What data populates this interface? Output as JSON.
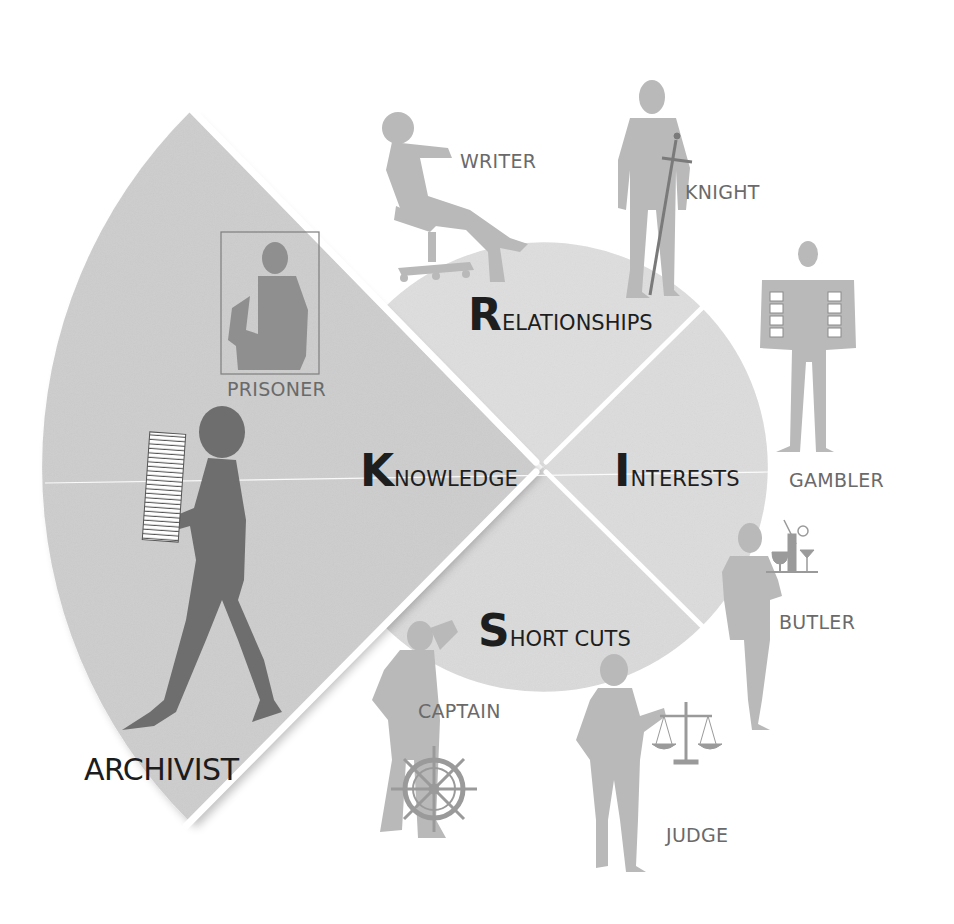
{
  "diagram": {
    "type": "segmented-circle-with-role-silhouettes",
    "center": [
      543,
      467
    ],
    "colors": {
      "background": "#ffffff",
      "segment_fill": "#dcdcdc",
      "knowledge_fill": "#cfcfcf",
      "divider": "#ffffff",
      "segment_text": "#1e1e1e",
      "role_text": "#6a6a6a",
      "archivist_text": "#1c1c1c",
      "silhouette_light": "#b9b9b9",
      "silhouette_dark": "#6e6e6e"
    },
    "segments": [
      {
        "id": "relationships",
        "initial": "R",
        "rest": "ELATIONSHIPS",
        "label": "Relationships"
      },
      {
        "id": "interests",
        "initial": "I",
        "rest": "NTERESTS",
        "label": "Interests"
      },
      {
        "id": "short_cuts",
        "initial": "S",
        "rest": "HORT CUTS",
        "label": "Short cuts"
      },
      {
        "id": "knowledge",
        "initial": "K",
        "rest": "NOWLEDGE",
        "label": "Knowledge",
        "highlighted": true
      }
    ],
    "roles": [
      {
        "id": "writer",
        "label": "WRITER",
        "segment": "relationships"
      },
      {
        "id": "knight",
        "label": "KNIGHT",
        "segment": "relationships"
      },
      {
        "id": "gambler",
        "label": "GAMBLER",
        "segment": "interests"
      },
      {
        "id": "butler",
        "label": "BUTLER",
        "segment": "interests"
      },
      {
        "id": "captain",
        "label": "CAPTAIN",
        "segment": "short_cuts"
      },
      {
        "id": "judge",
        "label": "JUDGE",
        "segment": "short_cuts"
      },
      {
        "id": "prisoner",
        "label": "PRISONER",
        "segment": "knowledge"
      },
      {
        "id": "archivist",
        "label": "ARCHIVIST",
        "segment": "knowledge",
        "highlighted": true
      }
    ]
  }
}
